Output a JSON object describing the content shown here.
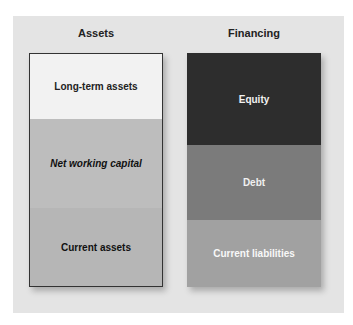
{
  "assets": {
    "heading": "Assets",
    "segments": [
      {
        "label": "Long-term assets",
        "color": "#f2f2f2"
      },
      {
        "label": "Net working capital",
        "color": "#bdbdbd"
      },
      {
        "label": "Current assets",
        "color": "#b6b6b6"
      }
    ]
  },
  "financing": {
    "heading": "Financing",
    "segments": [
      {
        "label": "Equity",
        "color": "#2d2d2d"
      },
      {
        "label": "Debt",
        "color": "#7b7b7b"
      },
      {
        "label": "Current liabilities",
        "color": "#a1a1a1"
      }
    ]
  }
}
